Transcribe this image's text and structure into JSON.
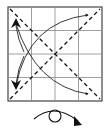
{
  "diagram": {
    "type": "origami-fold-diagram",
    "square": {
      "x": 8,
      "y": 7,
      "size": 94,
      "grid_divisions": 4,
      "border_color": "#444444",
      "grid_color": "#888888"
    },
    "valley_folds": [
      {
        "name": "diagonal-tl-br",
        "from": [
          8,
          7
        ],
        "to": [
          102,
          101
        ]
      },
      {
        "name": "diagonal-bl-tr",
        "from": [
          8,
          101
        ],
        "to": [
          102,
          7
        ]
      }
    ],
    "arrows": [
      {
        "name": "arrow-to-top-right",
        "direction": "bottom-left to top-right"
      },
      {
        "name": "arrow-to-top-left",
        "direction": "bottom-right to top-left"
      },
      {
        "name": "arrow-to-bottom-left",
        "direction": "top-right to bottom-left"
      },
      {
        "name": "arrow-to-bottom-right",
        "direction": "top-left to bottom-right"
      }
    ],
    "turn_over_symbol": {
      "label": "turn over",
      "icon": "flip-over-icon"
    },
    "stroke_color": "#111111"
  }
}
